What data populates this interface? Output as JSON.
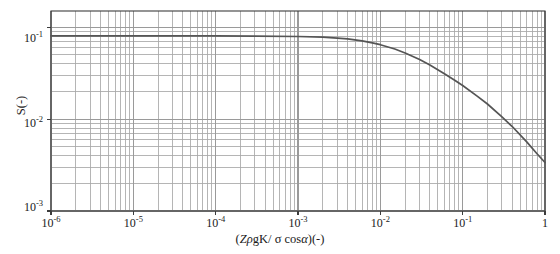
{
  "chart_data": {
    "type": "line",
    "title": "",
    "xlabel": "(ZρgK/ σ cosα)(-)",
    "ylabel": "S(-)",
    "xscale": "log",
    "yscale": "log",
    "xlim": [
      1e-06,
      1
    ],
    "ylim": [
      0.001,
      0.15
    ],
    "grid": true,
    "grid_minor": true,
    "legend": null,
    "xticks": [
      1e-06,
      1e-05,
      0.0001,
      0.001,
      0.01,
      0.1,
      1
    ],
    "xtick_labels": [
      "10-6",
      "10-5",
      "10-4",
      "10-3",
      "10-2",
      "10-1",
      "1"
    ],
    "yticks": [
      0.1,
      0.01,
      0.001
    ],
    "ytick_labels": [
      "10-1",
      "10-2",
      "10-3"
    ],
    "series": [
      {
        "name": "saturation-curve",
        "color": "#555555",
        "x": [
          1e-06,
          1e-05,
          0.0001,
          0.0003,
          0.001,
          0.002,
          0.003,
          0.004,
          0.006,
          0.008,
          0.01,
          0.015,
          0.02,
          0.03,
          0.04,
          0.06,
          0.08,
          0.1,
          0.15,
          0.2,
          0.3,
          0.4,
          0.6,
          0.8,
          1.0
        ],
        "y": [
          0.0805,
          0.0805,
          0.0803,
          0.08,
          0.0792,
          0.0778,
          0.0762,
          0.0745,
          0.071,
          0.0676,
          0.0645,
          0.0578,
          0.0524,
          0.0444,
          0.0388,
          0.0312,
          0.0265,
          0.0232,
          0.0178,
          0.0146,
          0.0106,
          0.0083,
          0.00565,
          0.0042,
          0.00337
        ]
      }
    ]
  },
  "axes": {
    "x_tick_positions_px": [
      51,
      133.3,
      215.7,
      298,
      380.3,
      462.7,
      545
    ],
    "y_tick_positions_px": [
      38,
      122.5,
      207
    ],
    "plot_left_px": 51,
    "plot_right_px": 545,
    "plot_top_px": 11,
    "plot_bottom_px": 211
  },
  "xtick_display": [
    {
      "base": "10",
      "exp": "-6"
    },
    {
      "base": "10",
      "exp": "-5"
    },
    {
      "base": "10",
      "exp": "-4"
    },
    {
      "base": "10",
      "exp": "-3"
    },
    {
      "base": "10",
      "exp": "-2"
    },
    {
      "base": "10",
      "exp": "-1"
    },
    {
      "base": "1",
      "exp": ""
    }
  ],
  "ytick_display": [
    {
      "base": "10",
      "exp": "-1"
    },
    {
      "base": "10",
      "exp": "-2"
    },
    {
      "base": "10",
      "exp": "-3"
    }
  ],
  "labels": {
    "xaxis_open_paren": "(",
    "xaxis_Z": "Z",
    "xaxis_rho": "ρ",
    "xaxis_gK": "gK",
    "xaxis_slash": "/ ",
    "xaxis_sigma": "σ",
    "xaxis_cos": " cos",
    "xaxis_alpha": "α",
    "xaxis_close": ")(-)",
    "yaxis_title": "S(-)"
  },
  "style": {
    "curve_color": "#555555",
    "grid_color": "#9a9a9a",
    "grid_minor_color": "#a8a8a8",
    "axis_color": "#3c3c3c",
    "text_color": "#1a1a1a",
    "background": "#ffffff"
  }
}
